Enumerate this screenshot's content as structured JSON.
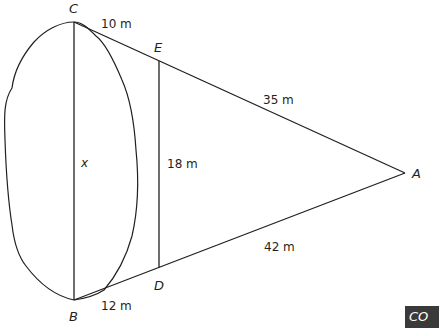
{
  "figure": {
    "points": {
      "A": "A",
      "B": "B",
      "C": "C",
      "D": "D",
      "E": "E"
    },
    "measurements": {
      "CE": "10 m",
      "EA": "35 m",
      "ED": "18 m",
      "BD": "12 m",
      "DA": "42 m",
      "CB": "x"
    },
    "colors": {
      "stroke": "#231f20",
      "background": "#ffffff",
      "badge": "#3a3a3a"
    }
  },
  "badge": {
    "text": "CO"
  }
}
